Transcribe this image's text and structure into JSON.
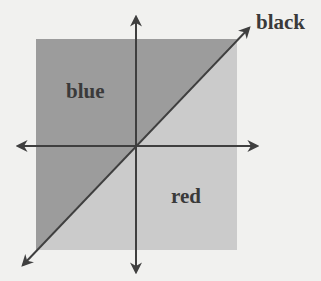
{
  "diagram": {
    "labels": {
      "upper_region": "blue",
      "lower_region": "red",
      "line": "black"
    },
    "colors": {
      "background": "#f1f1ef",
      "upper_region_fill": "#9c9c9c",
      "lower_region_fill": "#cbcbcb",
      "axis_color": "#3f3f3f",
      "text_color": "#3a3a3a"
    }
  }
}
